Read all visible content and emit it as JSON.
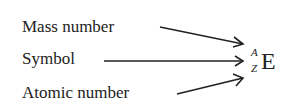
{
  "labels": {
    "mass_number": "Mass number",
    "symbol": "Symbol",
    "atomic_number": "Atomic number"
  },
  "notation": {
    "superscript": "A",
    "subscript": "Z",
    "element": "E"
  }
}
